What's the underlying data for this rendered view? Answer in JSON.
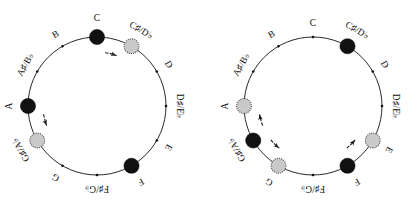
{
  "figure": {
    "panel_count": 2,
    "colors": {
      "black_node": "#111111",
      "gray_node": "#c9c9c9",
      "gray_node_edge": "#555555",
      "ring": "#111111",
      "arrow": "#1a1a1a",
      "background": "#ffffff"
    }
  },
  "note_names": [
    "C",
    "C♯/D♭",
    "D",
    "D♯/E♭",
    "E",
    "F",
    "F♯/G♭",
    "G",
    "G♯/A♭",
    "A",
    "A♯/B♭",
    "B"
  ],
  "panels": [
    {
      "id": "left",
      "name": "left-circle",
      "center": {
        "x": 97,
        "y": 106
      },
      "radius": 69,
      "nodes": [
        {
          "note": "C",
          "index": 0,
          "marker": "black",
          "label": "C"
        },
        {
          "note": "C♯/D♭",
          "index": 1,
          "marker": "gray",
          "label": "C♯/D♭"
        },
        {
          "note": "D",
          "index": 2,
          "marker": "tick",
          "label": "D"
        },
        {
          "note": "D♯/E♭",
          "index": 3,
          "marker": "tick",
          "label": "D♯/E♭"
        },
        {
          "note": "E",
          "index": 4,
          "marker": "tick",
          "label": "E"
        },
        {
          "note": "F",
          "index": 5,
          "marker": "black",
          "label": "F"
        },
        {
          "note": "F♯/G♭",
          "index": 6,
          "marker": "tick",
          "label": "F♯/G♭"
        },
        {
          "note": "G",
          "index": 7,
          "marker": "tick",
          "label": "G"
        },
        {
          "note": "G♯/A♭",
          "index": 8,
          "marker": "gray",
          "label": "G♯/A♭"
        },
        {
          "note": "A",
          "index": 9,
          "marker": "black",
          "label": "A"
        },
        {
          "note": "A♯/B♭",
          "index": 10,
          "marker": "tick",
          "label": "A♯/B♭"
        },
        {
          "note": "B",
          "index": 11,
          "marker": "tick",
          "label": "B"
        }
      ],
      "arrows": [
        {
          "from": "C",
          "to": "C♯/D♭",
          "from_index": 0,
          "to_index": 1,
          "direction": "clockwise"
        },
        {
          "from": "A",
          "to": "G♯/A♭",
          "from_index": 9,
          "to_index": 8,
          "direction": "counterclockwise"
        }
      ]
    },
    {
      "id": "right",
      "name": "right-circle",
      "center": {
        "x": 105,
        "y": 106
      },
      "radius": 69,
      "nodes": [
        {
          "note": "C",
          "index": 0,
          "marker": "tick",
          "label": "C"
        },
        {
          "note": "C♯/D♭",
          "index": 1,
          "marker": "black",
          "label": "C♯/D♭"
        },
        {
          "note": "D",
          "index": 2,
          "marker": "tick",
          "label": "D"
        },
        {
          "note": "D♯/E♭",
          "index": 3,
          "marker": "tick",
          "label": "D♯/E♭"
        },
        {
          "note": "E",
          "index": 4,
          "marker": "gray",
          "label": "E"
        },
        {
          "note": "F",
          "index": 5,
          "marker": "black",
          "label": "F"
        },
        {
          "note": "F♯/G♭",
          "index": 6,
          "marker": "tick",
          "label": "F♯/G♭"
        },
        {
          "note": "G",
          "index": 7,
          "marker": "gray",
          "label": "G"
        },
        {
          "note": "G♯/A♭",
          "index": 8,
          "marker": "black",
          "label": "G♯/A♭"
        },
        {
          "note": "A",
          "index": 9,
          "marker": "gray",
          "label": "A"
        },
        {
          "note": "A♯/B♭",
          "index": 10,
          "marker": "tick",
          "label": "A♯/B♭"
        },
        {
          "note": "B",
          "index": 11,
          "marker": "tick",
          "label": "B"
        }
      ],
      "arrows": [
        {
          "from": "F",
          "to": "E",
          "from_index": 5,
          "to_index": 4,
          "direction": "counterclockwise"
        },
        {
          "from": "G♯/A♭",
          "to": "A",
          "from_index": 8,
          "to_index": 9,
          "direction": "clockwise"
        },
        {
          "from": "G♯/A♭",
          "to": "G",
          "from_index": 8,
          "to_index": 7,
          "direction": "counterclockwise"
        }
      ]
    }
  ]
}
